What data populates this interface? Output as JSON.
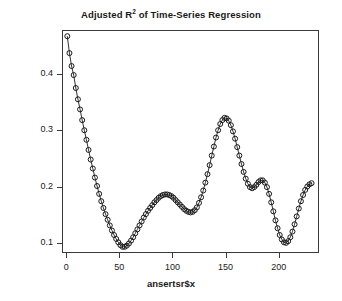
{
  "chart_data": {
    "type": "scatter",
    "title": "Adjusted R2 of Time-Series Regression",
    "title_base": "Adjusted R",
    "title_sup": "2",
    "title_tail": " of Time-Series Regression",
    "xlabel": "ansertsr$x",
    "ylabel": "ansertsr$y",
    "xlim": [
      -4,
      238
    ],
    "ylim": [
      0.082,
      0.478
    ],
    "grid": false,
    "legend": null,
    "marker": "open-circle",
    "line": "solid",
    "point_color": "#1a1a1a",
    "xticks": [
      0,
      50,
      100,
      150,
      200
    ],
    "xticklabels": [
      "0",
      "50",
      "100",
      "150",
      "200"
    ],
    "yticks": [
      0.1,
      0.2,
      0.3,
      0.4
    ],
    "yticklabels": [
      "0.1",
      "0.2",
      "0.3",
      "0.4"
    ],
    "x": [
      1,
      3,
      5,
      7,
      9,
      11,
      13,
      15,
      17,
      19,
      21,
      23,
      25,
      27,
      29,
      31,
      33,
      35,
      37,
      39,
      41,
      43,
      45,
      47,
      49,
      51,
      53,
      55,
      57,
      59,
      61,
      63,
      65,
      67,
      69,
      71,
      73,
      75,
      77,
      79,
      81,
      83,
      85,
      87,
      89,
      91,
      93,
      95,
      97,
      99,
      101,
      103,
      105,
      107,
      109,
      111,
      113,
      115,
      117,
      119,
      121,
      123,
      125,
      127,
      129,
      131,
      133,
      135,
      137,
      139,
      141,
      143,
      145,
      147,
      149,
      151,
      153,
      155,
      157,
      159,
      161,
      163,
      165,
      167,
      169,
      171,
      173,
      175,
      177,
      179,
      181,
      183,
      185,
      187,
      189,
      191,
      193,
      195,
      197,
      199,
      201,
      203,
      205,
      207,
      209,
      211,
      213,
      215,
      217,
      219,
      221,
      223,
      225,
      227,
      229,
      231
    ],
    "y": [
      0.467,
      0.437,
      0.414,
      0.398,
      0.375,
      0.355,
      0.337,
      0.318,
      0.3,
      0.283,
      0.265,
      0.248,
      0.232,
      0.216,
      0.201,
      0.187,
      0.174,
      0.162,
      0.151,
      0.141,
      0.131,
      0.122,
      0.114,
      0.107,
      0.101,
      0.096,
      0.093,
      0.093,
      0.095,
      0.099,
      0.104,
      0.11,
      0.117,
      0.124,
      0.131,
      0.138,
      0.145,
      0.151,
      0.157,
      0.162,
      0.167,
      0.172,
      0.176,
      0.18,
      0.183,
      0.185,
      0.186,
      0.186,
      0.185,
      0.183,
      0.18,
      0.176,
      0.172,
      0.168,
      0.164,
      0.16,
      0.157,
      0.155,
      0.154,
      0.155,
      0.158,
      0.163,
      0.171,
      0.181,
      0.193,
      0.207,
      0.222,
      0.238,
      0.255,
      0.271,
      0.287,
      0.3,
      0.311,
      0.318,
      0.322,
      0.321,
      0.317,
      0.309,
      0.298,
      0.285,
      0.27,
      0.255,
      0.24,
      0.226,
      0.214,
      0.205,
      0.199,
      0.197,
      0.199,
      0.203,
      0.208,
      0.211,
      0.211,
      0.207,
      0.199,
      0.187,
      0.172,
      0.156,
      0.14,
      0.126,
      0.114,
      0.106,
      0.101,
      0.1,
      0.103,
      0.11,
      0.12,
      0.133,
      0.147,
      0.161,
      0.174,
      0.185,
      0.194,
      0.2,
      0.204,
      0.206,
      0.206,
      0.204,
      0.201,
      0.197,
      0.193,
      0.19,
      0.188,
      0.187,
      0.188,
      0.191,
      0.195,
      0.199,
      0.203,
      0.206,
      0.207,
      0.205,
      0.201,
      0.195,
      0.188,
      0.182,
      0.178,
      0.176,
      0.177,
      0.18,
      0.186,
      0.192,
      0.197,
      0.2,
      0.2,
      0.197,
      0.192,
      0.185,
      0.178,
      0.172,
      0.167,
      0.164,
      0.163,
      0.166,
      0.173,
      0.184,
      0.198,
      0.214,
      0.232,
      0.251,
      0.27,
      0.288,
      0.304,
      0.318,
      0.328,
      0.335
    ]
  }
}
